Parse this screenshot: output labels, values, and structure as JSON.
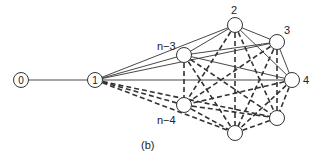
{
  "figure": {
    "caption": "(b)",
    "nodes": [
      {
        "id": "0",
        "label": "0",
        "x": 21,
        "y": 80,
        "label_inside": true
      },
      {
        "id": "1",
        "label": "1",
        "x": 95,
        "y": 80,
        "label_inside": true
      },
      {
        "id": "n-3",
        "label": "n−3",
        "x": 184,
        "y": 55,
        "label_inside": false,
        "lx": 157,
        "ly": 50
      },
      {
        "id": "2",
        "label": "2",
        "x": 235,
        "y": 25,
        "label_inside": false,
        "lx": 231,
        "ly": 14
      },
      {
        "id": "3",
        "label": "3",
        "x": 277,
        "y": 42,
        "label_inside": false,
        "lx": 284,
        "ly": 34
      },
      {
        "id": "4",
        "label": "4",
        "x": 292,
        "y": 80,
        "label_inside": false,
        "lx": 303,
        "ly": 84
      },
      {
        "id": "b5",
        "label": "",
        "x": 277,
        "y": 118,
        "label_inside": false
      },
      {
        "id": "b6",
        "label": "",
        "x": 235,
        "y": 133,
        "label_inside": false
      },
      {
        "id": "n-4",
        "label": "n−4",
        "x": 184,
        "y": 105,
        "label_inside": false,
        "lx": 157,
        "ly": 124
      }
    ],
    "solid_edges": [
      [
        "0",
        "1"
      ],
      [
        "1",
        "n-3"
      ],
      [
        "1",
        "2"
      ],
      [
        "1",
        "3"
      ],
      [
        "1",
        "4"
      ],
      [
        "n-3",
        "2"
      ],
      [
        "n-3",
        "3"
      ],
      [
        "n-3",
        "4"
      ],
      [
        "2",
        "3"
      ],
      [
        "2",
        "4"
      ],
      [
        "3",
        "4"
      ]
    ],
    "dashed_edges": [
      [
        "1",
        "n-4"
      ],
      [
        "1",
        "b6"
      ],
      [
        "1",
        "b5"
      ],
      [
        "n-3",
        "n-4"
      ],
      [
        "n-3",
        "b6"
      ],
      [
        "n-3",
        "b5"
      ],
      [
        "2",
        "n-4"
      ],
      [
        "2",
        "b6"
      ],
      [
        "2",
        "b5"
      ],
      [
        "3",
        "n-4"
      ],
      [
        "3",
        "b6"
      ],
      [
        "3",
        "b5"
      ],
      [
        "4",
        "n-4"
      ],
      [
        "4",
        "b6"
      ],
      [
        "4",
        "b5"
      ],
      [
        "n-4",
        "b6"
      ],
      [
        "n-4",
        "b5"
      ],
      [
        "b6",
        "b5"
      ]
    ],
    "colors": {
      "stroke": "#333333",
      "node_fill": "#ffffff",
      "background": "#ffffff"
    }
  }
}
